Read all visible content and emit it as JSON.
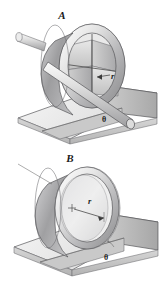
{
  "figure": {
    "background_color": "#ffffff",
    "outline_color": "#58585a",
    "label_color": "#1a1a1a",
    "panels": [
      {
        "id": "A",
        "label": "A",
        "body": "wheel-with-internal-vanes-and-axle",
        "radius_label": "r",
        "angle_label": "θ",
        "incline_label": "θ"
      },
      {
        "id": "B",
        "label": "B",
        "body": "thin-walled-hollow-ring",
        "radius_label": "r",
        "angle_label": "θ",
        "incline_label": "θ"
      }
    ],
    "shading": {
      "metal_light": "#f2f2f2",
      "metal_mid": "#d8d8d8",
      "metal_dark": "#a9a9ab",
      "metal_darkest": "#8c8c8e",
      "ramp_top": "#ededed",
      "ramp_side": "#cfcfcf",
      "ramp_front": "#bdbdbd"
    }
  }
}
